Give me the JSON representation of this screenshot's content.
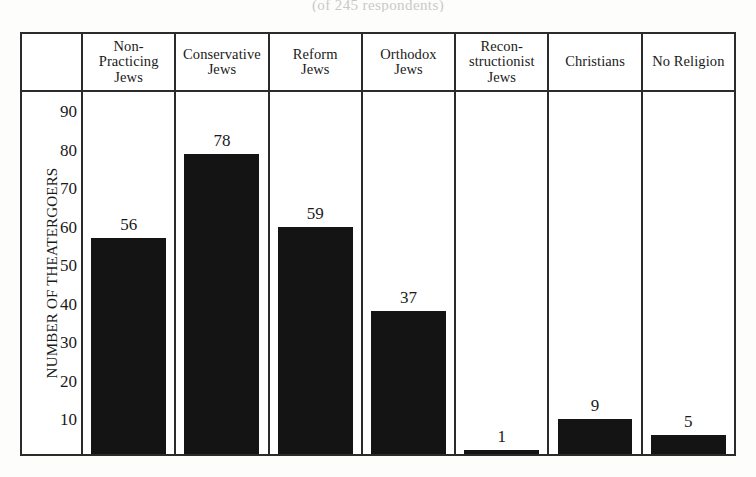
{
  "figure": {
    "title_remnant": "(of 245 respondents)",
    "frame_color": "#2b2b2b",
    "bar_color": "#141414",
    "background": "#ffffff"
  },
  "chart_data": {
    "type": "bar",
    "title": "",
    "subtitle": "(of 245 respondents)",
    "xlabel": "",
    "ylabel": "NUMBER OF THEATERGOERS",
    "ylim": [
      0,
      95
    ],
    "yticks": [
      10,
      20,
      30,
      40,
      50,
      60,
      70,
      80,
      90
    ],
    "grid": false,
    "legend": false,
    "value_labels": true,
    "categories": [
      "Non-Practicing Jews",
      "Conservative Jews",
      "Reform Jews",
      "Orthodox Jews",
      "Recon-structionist Jews",
      "Christians",
      "No Religion"
    ],
    "category_lines": [
      [
        "Non-",
        "Practicing",
        "Jews"
      ],
      [
        "Conservative",
        "Jews"
      ],
      [
        "Reform",
        "Jews"
      ],
      [
        "Orthodox",
        "Jews"
      ],
      [
        "Recon-",
        "structionist",
        "Jews"
      ],
      [
        "Christians"
      ],
      [
        "No Religion"
      ]
    ],
    "values": [
      56,
      78,
      59,
      37,
      1,
      9,
      5
    ]
  }
}
